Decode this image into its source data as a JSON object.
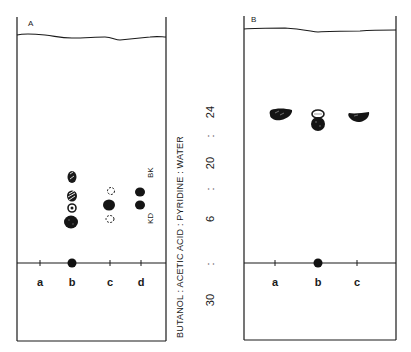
{
  "figure": {
    "panels": [
      {
        "id": "A",
        "label": "A",
        "lanes": [
          {
            "label": "a",
            "x": 40
          },
          {
            "label": "b",
            "x": 72
          },
          {
            "label": "c",
            "x": 110
          },
          {
            "label": "d",
            "x": 141
          }
        ],
        "annotations": [
          {
            "text": "BK",
            "x": 151,
            "y": 176
          },
          {
            "text": "KD",
            "x": 151,
            "y": 218
          }
        ]
      },
      {
        "id": "B",
        "label": "B",
        "lanes": [
          {
            "label": "a",
            "x": 275
          },
          {
            "label": "b",
            "x": 318
          },
          {
            "label": "c",
            "x": 357
          }
        ],
        "annotations": []
      }
    ],
    "solvent": {
      "text": "BUTANOL : ACETIC ACID : PYRIDINE : WATER",
      "ratio": [
        "30",
        ":",
        "6",
        ":",
        "20",
        ":",
        "24"
      ]
    },
    "colors": {
      "ink": "#1a1a1a",
      "background": "#ffffff"
    }
  }
}
